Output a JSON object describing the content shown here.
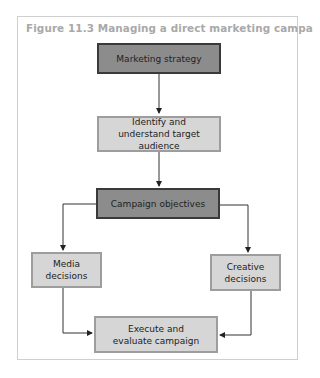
{
  "figure": {
    "title": "Figure 11.3 Managing a direct marketing campaign"
  },
  "nodes": {
    "marketing_strategy": "Marketing strategy",
    "target_audience": "Identify and understand target audience",
    "campaign_objectives": "Campaign objectives",
    "media_decisions": "Media decisions",
    "creative_decisions": "Creative decisions",
    "execute_evaluate": "Execute and evaluate campaign"
  },
  "colors": {
    "dark_box_fill": "#8c8c8c",
    "light_box_fill": "#d6d6d6",
    "title_text": "#a9a9a9"
  }
}
